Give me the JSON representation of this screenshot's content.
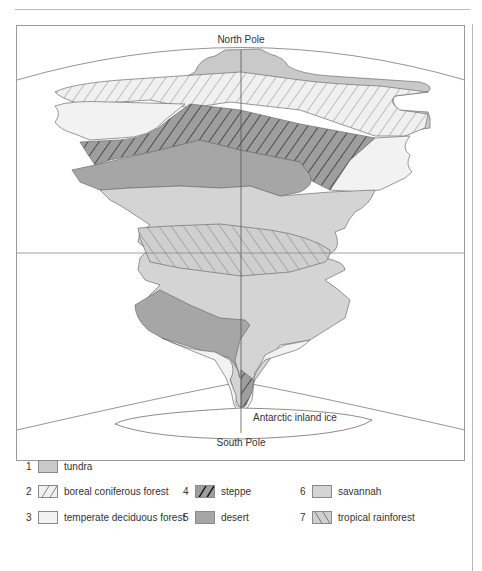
{
  "diagram": {
    "title_top": "North Pole",
    "title_bottom": "South Pole",
    "ice_label": "Antarctic inland ice",
    "colors": {
      "tundra": "#c9c9c9",
      "boreal": "#eeeeee",
      "temperate": "#f2f2f2",
      "steppe": "#9c9c9c",
      "desert": "#a8a8a8",
      "savannah": "#d4d4d4",
      "rainforest": "#cfcfcf",
      "outline": "#6f6f6f",
      "frame": "#9a9a9a"
    }
  },
  "legend": {
    "items": [
      {
        "number": "1",
        "label": "tundra",
        "pattern": "solid-light-gray"
      },
      {
        "number": "2",
        "label": "boreal coniferous forest",
        "pattern": "light-forward-hatch"
      },
      {
        "number": "3",
        "label": "temperate deciduous forest",
        "pattern": "solid-very-light"
      },
      {
        "number": "4",
        "label": "steppe",
        "pattern": "dark-forward-hatch"
      },
      {
        "number": "5",
        "label": "desert",
        "pattern": "solid-dark-gray"
      },
      {
        "number": "6",
        "label": "savannah",
        "pattern": "solid-gray"
      },
      {
        "number": "7",
        "label": "tropical rainforest",
        "pattern": "back-hatch"
      }
    ]
  }
}
